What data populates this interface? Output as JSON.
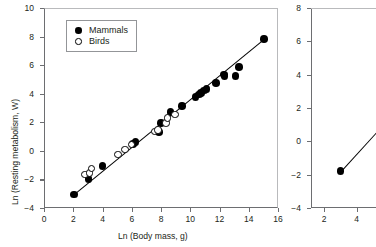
{
  "chart_data": [
    {
      "id": "left-panel",
      "type": "scatter",
      "title": "",
      "xlabel": "Ln (Body mass, g)",
      "ylabel": "Ln (Resting metabolism, W)",
      "xlim": [
        0,
        16
      ],
      "ylim": [
        -4,
        10
      ],
      "xticks": [
        0,
        2,
        4,
        6,
        8,
        10,
        12,
        14,
        16
      ],
      "yticks": [
        -4,
        -2,
        0,
        2,
        4,
        6,
        8,
        10
      ],
      "grid": false,
      "legend_position": "top-left",
      "legend": [
        {
          "label": "Mammals",
          "marker": "filled-circle",
          "color": "#000000"
        },
        {
          "label": "Birds",
          "marker": "open-circle",
          "color": "#000000"
        }
      ],
      "series": [
        {
          "name": "Mammals",
          "marker": "filled-circle",
          "points": [
            [
              2.05,
              -3.05
            ],
            [
              3.05,
              -1.95
            ],
            [
              4.0,
              -1.05
            ],
            [
              6.1,
              0.5
            ],
            [
              6.25,
              0.62
            ],
            [
              7.85,
              1.3
            ],
            [
              8.0,
              1.95
            ],
            [
              8.65,
              2.7
            ],
            [
              9.45,
              3.15
            ],
            [
              10.35,
              3.75
            ],
            [
              10.6,
              3.95
            ],
            [
              10.75,
              4.05
            ],
            [
              10.95,
              4.22
            ],
            [
              11.1,
              4.35
            ],
            [
              11.75,
              4.75
            ],
            [
              12.3,
              5.35
            ],
            [
              12.35,
              5.2
            ],
            [
              13.1,
              5.25
            ],
            [
              13.35,
              5.85
            ],
            [
              15.05,
              7.85
            ]
          ]
        },
        {
          "name": "Birds",
          "marker": "open-circle",
          "points": [
            [
              2.8,
              -1.65
            ],
            [
              3.1,
              -1.55
            ],
            [
              3.25,
              -1.25
            ],
            [
              5.05,
              -0.25
            ],
            [
              5.55,
              0.1
            ],
            [
              6.0,
              0.45
            ],
            [
              7.55,
              1.35
            ],
            [
              7.8,
              1.45
            ],
            [
              8.35,
              1.95
            ],
            [
              8.45,
              2.3
            ],
            [
              8.95,
              2.55
            ]
          ]
        }
      ],
      "fit_line": {
        "x0": 2.0,
        "y0": -3.1,
        "x1": 15.2,
        "y1": 7.95
      }
    },
    {
      "id": "right-panel",
      "type": "scatter",
      "title": "",
      "xlabel": "",
      "ylabel": "",
      "xlim": [
        1.2,
        5.2
      ],
      "ylim": [
        -4,
        8
      ],
      "xticks": [
        2,
        4
      ],
      "yticks": [
        -4,
        -2,
        0,
        2,
        4,
        6,
        8
      ],
      "grid": false,
      "cropped": true,
      "series": [
        {
          "name": "Mammals",
          "marker": "filled-circle",
          "points": [
            [
              3.02,
              -1.78
            ]
          ]
        }
      ],
      "fit_line": {
        "x0": 3.02,
        "y0": -1.78,
        "x1": 5.2,
        "y1": 0.55
      }
    }
  ]
}
